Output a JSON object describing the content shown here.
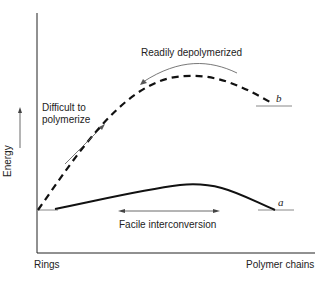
{
  "diagram": {
    "y_axis_label": "Energy",
    "x_axis_left_label": "Rings",
    "x_axis_right_label": "Polymer chains",
    "annotations": {
      "difficult_line1": "Difficult to",
      "difficult_line2": "polymerize",
      "depolymerized": "Readily depolymerized",
      "interconversion": "Facile interconversion"
    },
    "curves": [
      {
        "id": "a",
        "label": "a",
        "style": "solid",
        "description": "Low energy barrier between rings and polymer chains"
      },
      {
        "id": "b",
        "label": "b",
        "style": "dashed",
        "description": "High energy barrier; polymer higher in energy than rings"
      }
    ],
    "colors": {
      "line": "#111111",
      "guide": "#888888",
      "text": "#222222"
    }
  }
}
